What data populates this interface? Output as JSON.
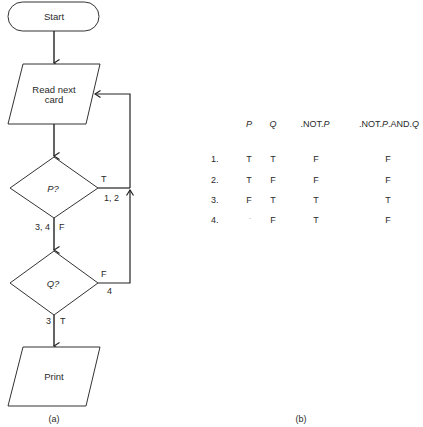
{
  "flowchart": {
    "start": "Start",
    "read_card": [
      "Read next",
      "card"
    ],
    "decision_p": "P?",
    "decision_q": "Q?",
    "print": "Print",
    "edge_p_true": "T",
    "edge_p_true_cases": "1, 2",
    "edge_p_false": "F",
    "edge_p_false_cases": "3, 4",
    "edge_q_false": "F",
    "edge_q_false_cases": "4",
    "edge_q_true": "T",
    "edge_q_true_cases": "3",
    "caption": "(a)"
  },
  "truth_table": {
    "headers": {
      "p": "P",
      "q": "Q",
      "not_p_pre": ".NOT.",
      "not_p_var": "P",
      "not_p_and_q_pre": ".NOT.",
      "not_p_and_q_var": "P",
      "not_p_and_q_mid": ".AND.",
      "not_p_and_q_var2": "Q"
    },
    "rows": [
      {
        "n": "1.",
        "p": "T",
        "q": "T",
        "not_p": "F",
        "not_p_and_q": "F"
      },
      {
        "n": "2.",
        "p": "T",
        "q": "F",
        "not_p": "F",
        "not_p_and_q": "F"
      },
      {
        "n": "3.",
        "p": "F",
        "q": "T",
        "not_p": "T",
        "not_p_and_q": "T"
      },
      {
        "n": "4.",
        "p": "·",
        "q": "F",
        "not_p": "T",
        "not_p_and_q": "F"
      }
    ],
    "caption": "(b)"
  }
}
